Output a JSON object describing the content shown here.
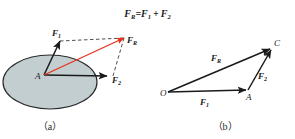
{
  "figure": {
    "title": {
      "full": "FR=F1 + F2",
      "main_symbol": "F",
      "resultant_sub": "R",
      "equals": "=",
      "term1_symbol": "F",
      "term1_sub": "1",
      "plus": "+",
      "term2_symbol": "F",
      "term2_sub": "2"
    },
    "colors": {
      "body_fill": "#c2ced0",
      "body_stroke": "#2b2b2b",
      "vector_stroke": "#1a1a1a",
      "resultant_red": "#e8301c",
      "dashed_stroke": "#3a3a3a",
      "text": "#1a1a1a",
      "background": "#ffffff"
    },
    "panel_a": {
      "caption": "（a）",
      "caption_text": "(a)",
      "description": "parallelogram-law-on-body",
      "body_shape": "ellipse",
      "point_label": "A",
      "vectors": [
        {
          "name": "F1",
          "symbol": "F",
          "sub": "1",
          "label_x": 52,
          "label_y": 36
        },
        {
          "name": "F2",
          "symbol": "F",
          "sub": "2",
          "label_x": 112,
          "label_y": 82
        },
        {
          "name": "FR",
          "symbol": "F",
          "sub": "R",
          "label_x": 126,
          "label_y": 43
        }
      ]
    },
    "panel_b": {
      "caption": "（b）",
      "caption_text": "(b)",
      "description": "triangle-law-vector-addition",
      "points": [
        {
          "name": "O",
          "label": "O",
          "x": 161,
          "y": 95
        },
        {
          "name": "A",
          "label": "A",
          "x": 249,
          "y": 95
        },
        {
          "name": "C",
          "label": "C",
          "x": 275,
          "y": 47
        }
      ],
      "vectors": [
        {
          "name": "F1",
          "symbol": "F",
          "sub": "1",
          "label_x": 203,
          "label_y": 104
        },
        {
          "name": "F2",
          "symbol": "F",
          "sub": "2",
          "label_x": 260,
          "label_y": 78
        },
        {
          "name": "FR",
          "symbol": "F",
          "sub": "R",
          "label_x": 214,
          "label_y": 60
        }
      ]
    }
  }
}
